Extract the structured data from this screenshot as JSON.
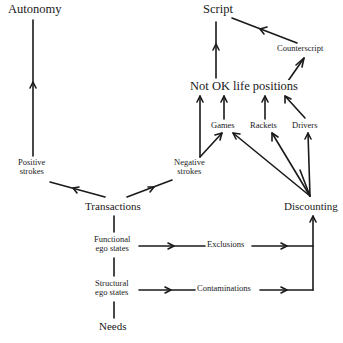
{
  "diagram": {
    "type": "flow-diagram",
    "nodes": {
      "autonomy": "Autonomy",
      "script": "Script",
      "counterscript": "Counterscript",
      "not_ok": "Not OK life positions",
      "games": "Games",
      "rackets": "Rackets",
      "drivers": "Drivers",
      "positive_strokes_1": "Positive",
      "positive_strokes_2": "strokes",
      "negative_strokes_1": "Negative",
      "negative_strokes_2": "strokes",
      "transactions": "Transactions",
      "discounting": "Discounting",
      "functional_1": "Functional",
      "functional_2": "ego states",
      "structural_1": "Structural",
      "structural_2": "ego states",
      "exclusions": "Exclusions",
      "contaminations": "Contaminations",
      "needs": "Needs"
    },
    "edges": [
      {
        "from": "Positive strokes",
        "to": "Autonomy"
      },
      {
        "from": "Not OK life positions",
        "to": "Script"
      },
      {
        "from": "Counterscript",
        "to": "Script"
      },
      {
        "from": "Not OK life positions",
        "to": "Counterscript"
      },
      {
        "from": "Games",
        "to": "Not OK life positions"
      },
      {
        "from": "Rackets",
        "to": "Not OK life positions"
      },
      {
        "from": "Drivers",
        "to": "Not OK life positions"
      },
      {
        "from": "Negative strokes",
        "to": "Not OK life positions"
      },
      {
        "from": "Negative strokes",
        "to": "Games"
      },
      {
        "from": "Transactions",
        "to": "Positive strokes"
      },
      {
        "from": "Transactions",
        "to": "Negative strokes"
      },
      {
        "from": "Discounting",
        "to": "Not OK life positions"
      },
      {
        "from": "Discounting",
        "to": "Games"
      },
      {
        "from": "Discounting",
        "to": "Rackets"
      },
      {
        "from": "Discounting",
        "to": "Drivers"
      },
      {
        "from": "Transactions",
        "to": "Functional ego states",
        "style": "line"
      },
      {
        "from": "Functional ego states",
        "to": "Structural ego states",
        "style": "line"
      },
      {
        "from": "Structural ego states",
        "to": "Needs",
        "style": "line"
      },
      {
        "from": "Functional ego states",
        "to": "Exclusions"
      },
      {
        "from": "Exclusions",
        "to": "Discounting"
      },
      {
        "from": "Structural ego states",
        "to": "Contaminations"
      },
      {
        "from": "Contaminations",
        "to": "Discounting"
      }
    ]
  }
}
